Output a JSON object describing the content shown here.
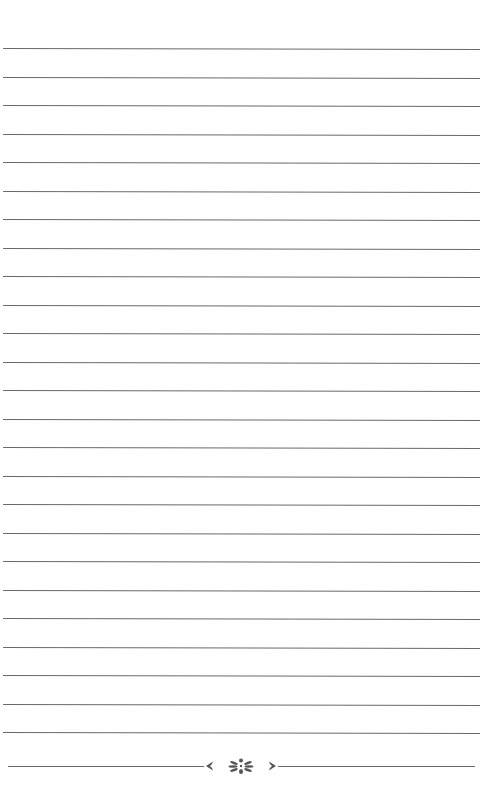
{
  "page": {
    "type": "lined-notebook-page",
    "background": "#ffffff",
    "rule_color": "#6a6a6a",
    "rule_count": 25,
    "first_rule_y": 48,
    "rule_spacing": 28.5
  },
  "footer": {
    "ornament": "floral-divider-icon",
    "ornament_color": "#555555"
  }
}
